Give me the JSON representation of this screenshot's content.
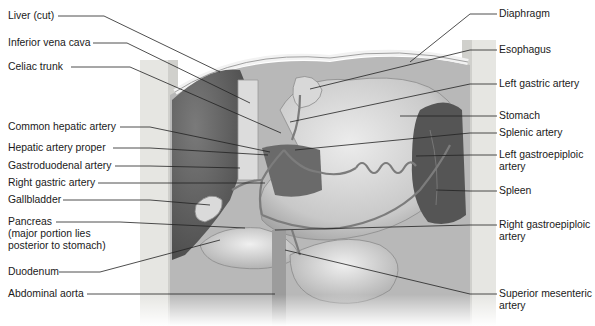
{
  "figure": {
    "left_labels": [
      {
        "id": "liver",
        "text": "Liver (cut)"
      },
      {
        "id": "ivc",
        "text": "Inferior vena cava"
      },
      {
        "id": "celiac",
        "text": "Celiac trunk"
      },
      {
        "id": "cha",
        "text": "Common hepatic artery"
      },
      {
        "id": "hap",
        "text": "Hepatic artery proper"
      },
      {
        "id": "gda",
        "text": "Gastroduodenal artery"
      },
      {
        "id": "rga",
        "text": "Right gastric artery"
      },
      {
        "id": "gallbladder",
        "text": "Gallbladder"
      },
      {
        "id": "pancreas",
        "lines": [
          "Pancreas",
          "(major portion lies",
          "posterior to stomach)"
        ]
      },
      {
        "id": "duodenum",
        "text": "Duodenum"
      },
      {
        "id": "aorta",
        "text": "Abdominal aorta"
      }
    ],
    "right_labels": [
      {
        "id": "diaphragm",
        "text": "Diaphragm"
      },
      {
        "id": "esophagus",
        "text": "Esophagus"
      },
      {
        "id": "lga",
        "text": "Left gastric artery"
      },
      {
        "id": "stomach",
        "text": "Stomach"
      },
      {
        "id": "splenic",
        "text": "Splenic artery"
      },
      {
        "id": "lgea",
        "lines": [
          "Left gastroepiploic",
          "artery"
        ]
      },
      {
        "id": "spleen",
        "text": "Spleen"
      },
      {
        "id": "rgea",
        "lines": [
          "Right gastroepiploic",
          "artery"
        ]
      },
      {
        "id": "sma",
        "lines": [
          "Superior mesenteric",
          "artery"
        ]
      }
    ],
    "colors": {
      "text": "#1a1a1a",
      "leader": "#222222",
      "body_wall": "#e4e4e0",
      "liver": "#6a6a6a",
      "stomach": "#cfcfcf",
      "vessel": "#8a8a8a",
      "spleen": "#5a5a5a"
    }
  }
}
